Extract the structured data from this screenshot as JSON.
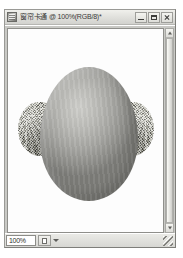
{
  "window": {
    "title": "窗帘卡通 @ 100%(RGB/8)*",
    "doc_icon": "photoshop-document-icon",
    "controls": {
      "minimize_label": "",
      "maximize_label": "",
      "close_label": ""
    }
  },
  "canvas": {
    "artwork_description": "grey egg-shaped oval with two fuzzy textured tufts",
    "background_color": "#fdfdfd",
    "egg_color": "#a2a29e",
    "tuft_color": "#8f8f8c"
  },
  "scrollbar": {
    "up_arrow": "chevron-up-icon",
    "down_arrow": "chevron-down-icon"
  },
  "status_bar": {
    "zoom_value": "100%",
    "zoom_placeholder": "100%",
    "doc_button": "document-size-button",
    "info_text": ""
  }
}
